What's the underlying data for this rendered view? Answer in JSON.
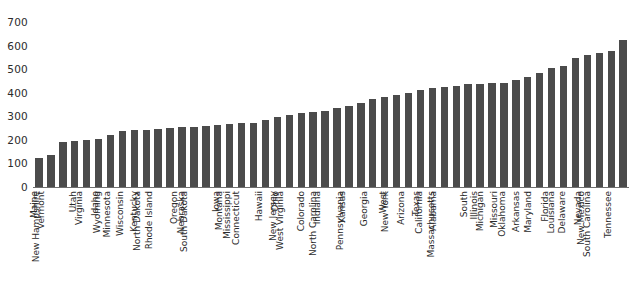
{
  "chart_data": {
    "type": "bar",
    "title": "",
    "subtitle": "",
    "xlabel": "",
    "ylabel": "",
    "ylim": [
      0,
      700
    ],
    "yticks": [
      0,
      100,
      200,
      300,
      400,
      500,
      600,
      700
    ],
    "ytick_labels": [
      "0",
      "100",
      "200",
      "300",
      "400",
      "500",
      "600",
      "700"
    ],
    "grid": false,
    "legend": null,
    "bar_color": "#4b4b4b",
    "axis_color": "#6f6f6f",
    "text_color": "#2b2b2b",
    "background": "#ffffff",
    "categories": [
      "Maine",
      "Vermont",
      "New Hampshire",
      "Utah",
      "Virginia",
      "Idaho",
      "Wyoming",
      "Minnesota",
      "Wisconsin",
      "Kentucky",
      "North Dakota",
      "Rhode Island",
      "Oregon",
      "Nebraska",
      "South Dakota",
      "Iowa",
      "Montana",
      "Mississippi",
      "Connecticut",
      "Hawaii",
      "Ohio",
      "New Jersey",
      "West Virginia",
      "Colorado",
      "Indiana",
      "North Carolina",
      "Kansas",
      "Pennsylvania",
      "Georgia",
      "West",
      "New York",
      "Arizona",
      "Texas",
      "California",
      "Alabama",
      "Massachusetts",
      "South",
      "Illinois",
      "Michigan",
      "Missouri",
      "Oklahoma",
      "Arkansas",
      "Maryland",
      "Florida",
      "Louisiana",
      "Delaware",
      "Nevada",
      "New Mexico",
      "South Carolina",
      "Tennessee"
    ],
    "values": [
      123,
      136,
      190,
      196,
      200,
      203,
      222,
      236,
      240,
      243,
      247,
      250,
      253,
      256,
      258,
      262,
      266,
      270,
      272,
      285,
      295,
      305,
      312,
      318,
      322,
      335,
      345,
      355,
      374,
      380,
      392,
      400,
      410,
      418,
      424,
      428,
      436,
      438,
      440,
      443,
      455,
      468,
      484,
      504,
      512,
      548,
      562,
      570,
      578,
      623
    ]
  }
}
